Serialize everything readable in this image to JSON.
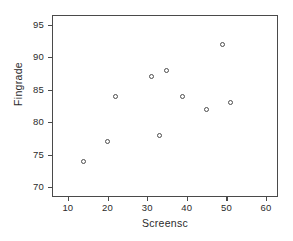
{
  "chart_data": {
    "type": "scatter",
    "title": "",
    "xlabel": "Screensc",
    "ylabel": "Fingrade",
    "xlim": [
      6,
      63
    ],
    "ylim": [
      68.5,
      96.5
    ],
    "xticks": [
      10,
      20,
      30,
      40,
      50,
      60
    ],
    "yticks": [
      70,
      75,
      80,
      85,
      90,
      95
    ],
    "grid": false,
    "legend": null,
    "marker": "open-circle",
    "marker_color": "#4d4d4d",
    "x": [
      14,
      20,
      22,
      31,
      33,
      35,
      39,
      45,
      49,
      51
    ],
    "y": [
      74,
      77,
      84,
      87,
      78,
      88,
      84,
      82,
      92,
      83
    ],
    "points": [
      {
        "x": 14,
        "y": 74
      },
      {
        "x": 20,
        "y": 77
      },
      {
        "x": 22,
        "y": 84
      },
      {
        "x": 31,
        "y": 87
      },
      {
        "x": 33,
        "y": 78
      },
      {
        "x": 35,
        "y": 88
      },
      {
        "x": 39,
        "y": 84
      },
      {
        "x": 45,
        "y": 82
      },
      {
        "x": 49,
        "y": 92
      },
      {
        "x": 51,
        "y": 83
      }
    ]
  },
  "axes": {
    "x_tick_labels": [
      "10",
      "20",
      "30",
      "40",
      "50",
      "60"
    ],
    "y_tick_labels": [
      "70",
      "75",
      "80",
      "85",
      "90",
      "95"
    ],
    "x_title": "Screensc",
    "y_title": "Fingrade"
  },
  "style": {
    "frame_color": "#4a4a4a",
    "marker_color": "#4d4d4d",
    "text_color": "#2b2b2b",
    "background": "#ffffff"
  }
}
